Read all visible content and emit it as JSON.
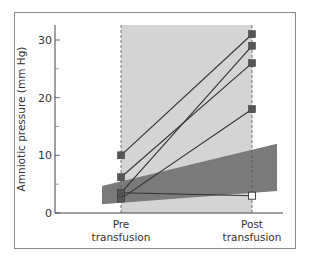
{
  "chart_data": {
    "type": "line",
    "title": "",
    "xlabel": "",
    "ylabel": "Amniotic pressure (mm Hg)",
    "categories": [
      "Pre transfusion",
      "Post transfusion"
    ],
    "category_labels": [
      [
        "Pre",
        "transfusion"
      ],
      [
        "Post",
        "transfusion"
      ]
    ],
    "ylim": [
      0,
      32
    ],
    "yticks": [
      0,
      10,
      20,
      30
    ],
    "yticks_minor": [
      5,
      15,
      25
    ],
    "grid": false,
    "legend": null,
    "series": [
      {
        "name": "Patient 1",
        "values": [
          10,
          31
        ],
        "post_marker": "filled"
      },
      {
        "name": "Patient 2",
        "values": [
          6.2,
          26
        ],
        "post_marker": "filled"
      },
      {
        "name": "Patient 3",
        "values": [
          3.5,
          29
        ],
        "post_marker": "filled"
      },
      {
        "name": "Patient 4",
        "values": [
          2.5,
          18
        ],
        "post_marker": "filled"
      },
      {
        "name": "Patient 5",
        "values": [
          3.5,
          3
        ],
        "post_marker": "open"
      }
    ],
    "shaded_regions": [
      {
        "name": "transfusion-interval",
        "x_from": "Pre transfusion",
        "x_to": "Post transfusion",
        "color": "#d4d4d4"
      },
      {
        "name": "normal-range-band",
        "left": {
          "low": 1.5,
          "high": 4.7
        },
        "right": {
          "low": 3.8,
          "high": 12.0
        },
        "color": "#7a7a7a"
      }
    ]
  },
  "colors": {
    "frame": "#8a8a8a",
    "light_band": "#d4d4d4",
    "dark_band": "#7a7a7a",
    "line": "#333333",
    "marker": "#555555"
  }
}
